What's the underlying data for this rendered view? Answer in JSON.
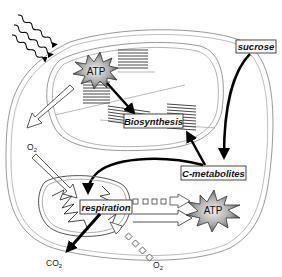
{
  "diagram": {
    "type": "plant cell energy metabolism",
    "compartments": {
      "cell": "cell",
      "chloroplast": "chloroplast",
      "mitochondrion": "mitochondrion"
    },
    "labels": {
      "sucrose": "sucrose",
      "biosynthesis": "Biosynthesis",
      "c_metabolites": "C-metabolites",
      "respiration": "respiration",
      "atp_chloroplast": "ATP",
      "atp_cytosol": "ATP",
      "o2_top": "O",
      "o2_top_sub": "2",
      "o2_bottom": "O",
      "o2_bottom_sub": "2",
      "co2": "CO",
      "co2_sub": "2"
    },
    "flows": [
      {
        "from": "light",
        "to": "ATP (chloroplast)",
        "style": "wavy arrows"
      },
      {
        "from": "ATP (chloroplast)",
        "to": "Biosynthesis",
        "style": "solid black arrow"
      },
      {
        "from": "chloroplast",
        "to": "O2",
        "style": "hollow arrow"
      },
      {
        "from": "O2",
        "to": "respiration",
        "style": "hollow arrow"
      },
      {
        "from": "sucrose",
        "to": "C-metabolites",
        "style": "solid black curved arrow"
      },
      {
        "from": "C-metabolites",
        "to": "Biosynthesis",
        "style": "solid black arrow"
      },
      {
        "from": "C-metabolites",
        "to": "respiration",
        "style": "solid black curved arrow"
      },
      {
        "from": "respiration",
        "to": "ATP (cytosol)",
        "style": "hollow arrow with squares"
      },
      {
        "from": "respiration",
        "to": "CO2",
        "style": "solid black arrow"
      },
      {
        "from": "O2",
        "to": "respiration",
        "style": "dotted squares hollow arrow"
      }
    ],
    "colors": {
      "membrane": "#9a9a9a",
      "arrow_solid": "#000000",
      "atp_star_dark": "#555555",
      "atp_star_light": "#e8e8e8",
      "box_border": "#333333"
    }
  }
}
